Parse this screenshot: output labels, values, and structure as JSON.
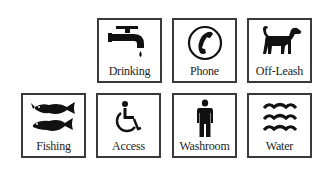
{
  "signs": [
    {
      "id": "drinking",
      "label": "Drinking",
      "icon": "water-faucet-icon",
      "row": 1,
      "col": 1
    },
    {
      "id": "phone",
      "label": "Phone",
      "icon": "telephone-icon",
      "row": 1,
      "col": 2
    },
    {
      "id": "off-leash",
      "label": "Off-Leash",
      "icon": "dog-icon",
      "row": 1,
      "col": 3
    },
    {
      "id": "fishing",
      "label": "Fishing",
      "icon": "fish-icon",
      "row": 2,
      "col": 0
    },
    {
      "id": "access",
      "label": "Access",
      "icon": "wheelchair-icon",
      "row": 2,
      "col": 1
    },
    {
      "id": "washroom",
      "label": "Washroom",
      "icon": "person-icon",
      "row": 2,
      "col": 2
    },
    {
      "id": "water",
      "label": "Water",
      "icon": "waves-icon",
      "row": 2,
      "col": 3
    }
  ],
  "colors": {
    "border": "#3a3a3a",
    "icon": "#111111",
    "text": "#222222",
    "background": "#ffffff"
  }
}
